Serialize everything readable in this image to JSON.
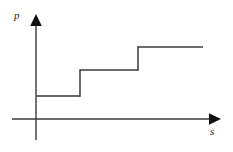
{
  "figure": {
    "width": 233,
    "height": 152,
    "background_color": "#ffffff"
  },
  "axes": {
    "y_axis": {
      "label": "p",
      "name": "y-axis",
      "x": 36,
      "top": 18,
      "bottom": 140,
      "arrow": "up",
      "label_x": 14,
      "label_y": 10
    },
    "x_axis": {
      "label": "s",
      "name": "x-axis",
      "y": 119,
      "left": 12,
      "right": 220,
      "arrow": "right",
      "label_x": 210,
      "label_y": 126
    },
    "origin": {
      "x": 36,
      "y": 119
    },
    "line_color": "#3a3a3a",
    "line_width": 1.4
  },
  "chart_data": {
    "type": "line",
    "title": "",
    "subtitle": "",
    "xlabel": "s",
    "ylabel": "p",
    "legend": [],
    "grid": false,
    "axis_arrows": true,
    "tick_labels": {
      "x": [],
      "y": []
    },
    "xlim": [
      0,
      100
    ],
    "ylim": [
      0,
      100
    ],
    "step_style": "post",
    "series": [
      {
        "name": "p(s)",
        "color": "#3a3a3a",
        "step_count": 3,
        "x": [
          0,
          26,
          26,
          61,
          61,
          100
        ],
        "y": [
          19,
          19,
          40,
          40,
          59,
          59
        ],
        "steps": [
          {
            "index": 1,
            "x_start": 0,
            "x_end": 26,
            "value": 19,
            "px": {
              "x1": 36,
              "x2": 80,
              "y": 96
            }
          },
          {
            "index": 2,
            "x_start": 26,
            "x_end": 61,
            "value": 40,
            "px": {
              "x1": 80,
              "x2": 138,
              "y": 70
            }
          },
          {
            "index": 3,
            "x_start": 61,
            "x_end": 100,
            "value": 59,
            "px": {
              "x1": 138,
              "x2": 203,
              "y": 47
            }
          }
        ],
        "risers": [
          {
            "x": 26,
            "from": 19,
            "to": 40,
            "px": {
              "x": 80,
              "y1": 96,
              "y2": 70
            }
          },
          {
            "x": 61,
            "from": 40,
            "to": 59,
            "px": {
              "x": 138,
              "y1": 70,
              "y2": 47
            }
          }
        ]
      }
    ]
  }
}
